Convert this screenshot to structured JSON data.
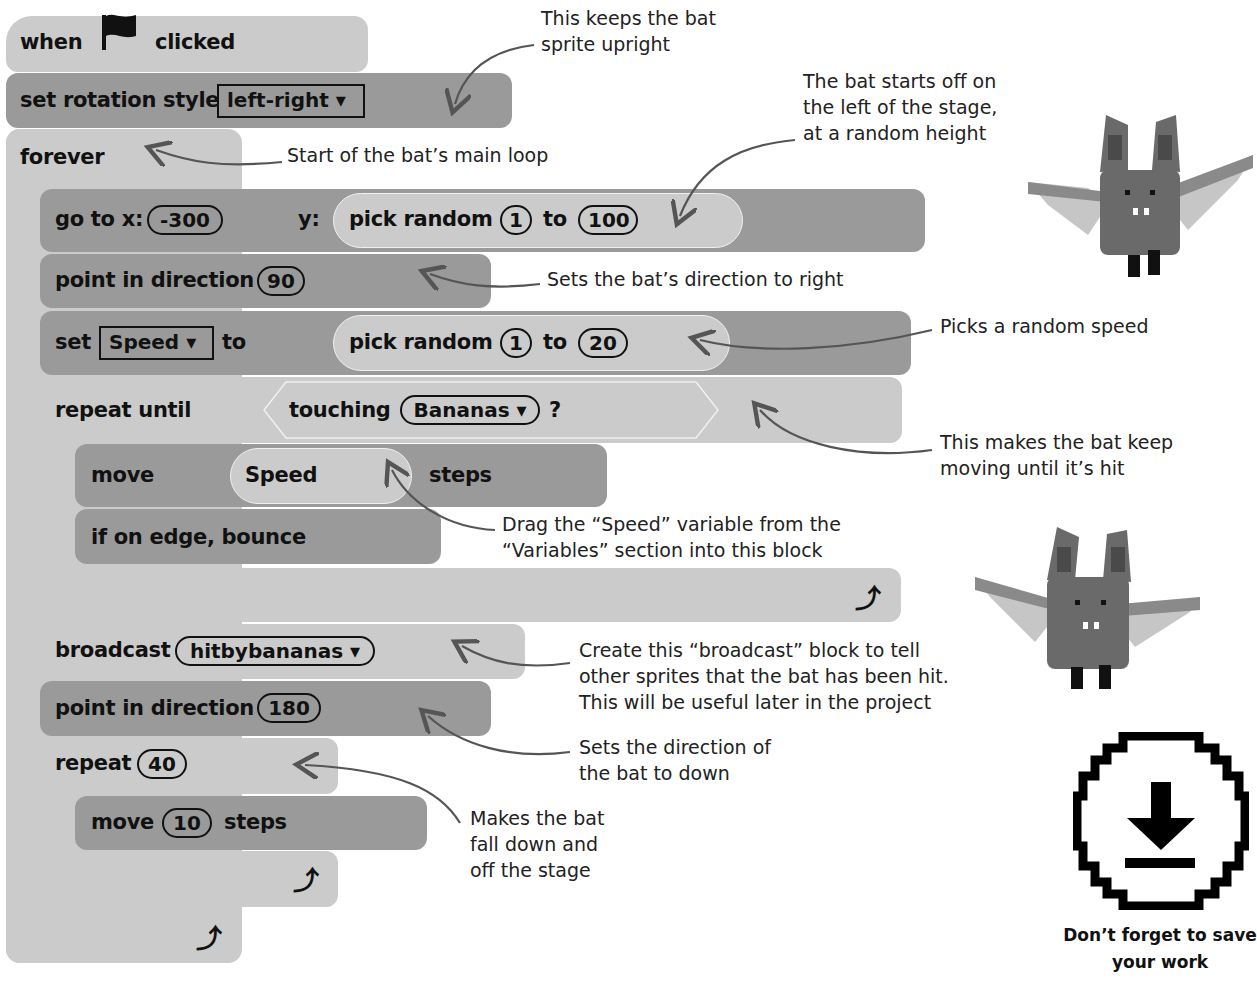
{
  "script": {
    "hat": {
      "when": "when",
      "clicked": "clicked",
      "icon": "green-flag-icon"
    },
    "set_rotation": {
      "label": "set rotation style",
      "value": "left-right"
    },
    "forever": {
      "label": "forever",
      "loop_icon": "↺"
    },
    "goto": {
      "label_x": "go to x:",
      "x": "-300",
      "label_y": "y:",
      "random_label": "pick random",
      "from": "1",
      "to_label": "to",
      "to": "100"
    },
    "point1": {
      "label": "point in direction",
      "value": "90"
    },
    "set_var": {
      "label": "set",
      "var": "Speed",
      "to_label": "to",
      "random_label": "pick random",
      "from": "1",
      "to_word": "to",
      "to": "20"
    },
    "repeat_until": {
      "label": "repeat until",
      "touching": "touching",
      "object": "Bananas",
      "q": "?"
    },
    "move_speed": {
      "label": "move",
      "var": "Speed",
      "steps": "steps"
    },
    "bounce": {
      "label": "if on edge, bounce"
    },
    "broadcast": {
      "label": "broadcast",
      "message": "hitbybananas"
    },
    "point2": {
      "label": "point in direction",
      "value": "180"
    },
    "repeat": {
      "label": "repeat",
      "count": "40"
    },
    "move10": {
      "label": "move",
      "value": "10",
      "steps": "steps"
    },
    "dropdown_glyph": "▾",
    "loop_glyph": "⤴"
  },
  "annotations": {
    "upright": "This keeps the bat\nsprite upright",
    "start_left": "The bat starts off on\nthe left of the stage,\nat a random height",
    "main_loop": "Start of the bat’s main loop",
    "dir_right": "Sets the bat’s direction to right",
    "random_speed": "Picks a random speed",
    "keep_moving": "This makes the bat keep\nmoving until it’s hit",
    "drag_speed": "Drag the “Speed” variable from the\n“Variables” section into this block",
    "broadcast_note": "Create this “broadcast” block to tell\nother sprites that the bat has been hit.\nThis will be useful later in the project",
    "dir_down": "Sets the direction of\nthe bat to down",
    "fall": "Makes the bat\nfall down and\noff the stage"
  },
  "sidebar": {
    "bat_sprite_1": "bat-sprite",
    "bat_sprite_2": "bat-sprite",
    "save_caption": "Don’t forget to save\nyour work",
    "save_icon": "download-save-icon"
  },
  "colors": {
    "light_block": "#cbcbcb",
    "dark_block": "#9a9a9a",
    "text": "#111111",
    "arrow": "#555555"
  }
}
